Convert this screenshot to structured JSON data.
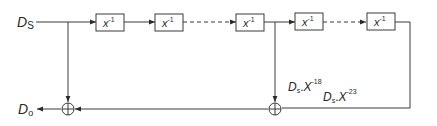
{
  "diagram": {
    "input_label": {
      "main": "D",
      "sub": "S"
    },
    "output_label": {
      "main": "D",
      "sub": "o"
    },
    "delay_blocks": [
      {
        "id": "delay-1",
        "base": "x",
        "exp": "-1"
      },
      {
        "id": "delay-2",
        "base": "x",
        "exp": "-1"
      },
      {
        "id": "delay-3",
        "base": "x",
        "exp": "-1"
      },
      {
        "id": "delay-4",
        "base": "x",
        "exp": "-1"
      },
      {
        "id": "delay-5",
        "base": "x",
        "exp": "-1"
      }
    ],
    "tap_labels": [
      {
        "main": "D",
        "sub": "s",
        "sep": ".",
        "base": "X",
        "exp": "-18"
      },
      {
        "main": "D",
        "sub": "s",
        "sep": ".",
        "base": "X",
        "exp": "-23"
      }
    ],
    "adders": [
      {
        "id": "adder-1",
        "symbol": "plus-circle"
      },
      {
        "id": "adder-2",
        "symbol": "plus-circle"
      }
    ],
    "colors": {
      "line": "#3a3a3a",
      "text": "#2a2a2a",
      "background": "#ffffff"
    }
  }
}
